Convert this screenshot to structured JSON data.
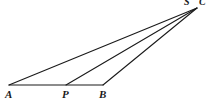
{
  "figure": {
    "type": "geometry-diagram",
    "background_color": "#ffffff",
    "stroke_color": "#1a1a1a",
    "points": [
      {
        "id": "A",
        "label": "A",
        "x": 9,
        "y": 85
      },
      {
        "id": "P",
        "label": "P",
        "x": 66,
        "y": 85
      },
      {
        "id": "B",
        "label": "B",
        "x": 103,
        "y": 85
      },
      {
        "id": "S",
        "label": "S",
        "x": 188,
        "y": 6
      },
      {
        "id": "C",
        "label": "C",
        "x": 202,
        "y": 5
      }
    ],
    "segments": [
      {
        "id": "AB",
        "from": "A",
        "to": "B",
        "x1": 9,
        "y1": 85,
        "x2": 103,
        "y2": 85
      },
      {
        "id": "AC",
        "from": "A",
        "to": "apex",
        "x1": 9,
        "y1": 85,
        "x2": 197,
        "y2": 8
      },
      {
        "id": "PC",
        "from": "P",
        "to": "apex",
        "x1": 66,
        "y1": 85,
        "x2": 197,
        "y2": 8
      },
      {
        "id": "BC",
        "from": "B",
        "to": "apex",
        "x1": 103,
        "y1": 85,
        "x2": 197,
        "y2": 8
      }
    ],
    "apex": {
      "x": 197,
      "y": 8
    }
  }
}
